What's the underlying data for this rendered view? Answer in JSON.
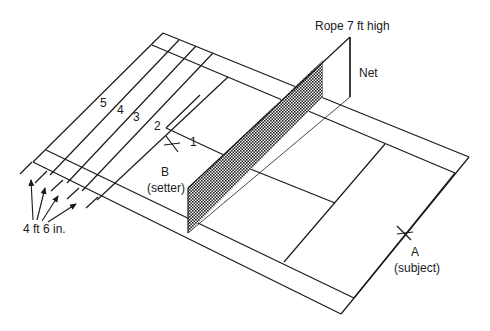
{
  "diagram": {
    "type": "badminton court setup (isometric)",
    "labels": {
      "rope": "Rope 7 ft high",
      "net": "Net",
      "setter_letter": "B",
      "setter_role": "(setter)",
      "subject_letter": "A",
      "subject_role": "(subject)",
      "spacing": "4 ft 6 in."
    },
    "zones": [
      "1",
      "2",
      "3",
      "4",
      "5"
    ],
    "colors": {
      "line": "#1a1a1a",
      "background": "#ffffff"
    }
  }
}
